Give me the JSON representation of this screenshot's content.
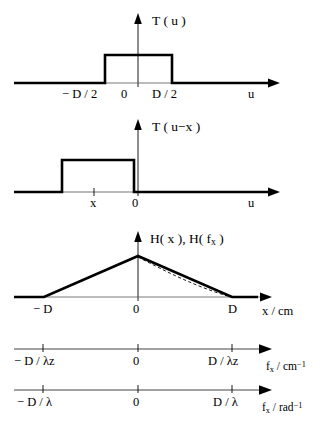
{
  "figure": {
    "panels": [
      {
        "id": "panel-tu",
        "type": "rect-function",
        "function_label": "T ( u )",
        "axis_label": "u",
        "ticks": [
          {
            "label": "− D / 2"
          },
          {
            "label": "0"
          },
          {
            "label": "D / 2"
          }
        ]
      },
      {
        "id": "panel-tux",
        "type": "rect-function-shifted",
        "function_label": "T ( u−x )",
        "axis_label": "u",
        "ticks": [
          {
            "label": "x"
          },
          {
            "label": "0"
          }
        ]
      },
      {
        "id": "panel-hx",
        "type": "triangle-function",
        "function_label_parts": {
          "lead": "H( x ), H( f",
          "subscript": "x",
          "trail": " )"
        },
        "function_label": "H( x ), H( f x )",
        "axis_label": "x / cm",
        "ticks": [
          {
            "label": "− D"
          },
          {
            "label": "0"
          },
          {
            "label": "D"
          }
        ],
        "has_dashed_overlay": true
      },
      {
        "id": "panel-fx-cm",
        "type": "numeric-axis",
        "axis_label_parts": {
          "lead": "f",
          "subscript": "x",
          "mid": " / cm",
          "superscript": "−1"
        },
        "axis_label": "f x / cm -1",
        "ticks": [
          {
            "label": "− D / λz"
          },
          {
            "label": "0"
          },
          {
            "label": "D / λz"
          }
        ]
      },
      {
        "id": "panel-fx-rad",
        "type": "numeric-axis",
        "axis_label_parts": {
          "lead": "f",
          "subscript": "x",
          "mid": " / rad",
          "superscript": "−1"
        },
        "axis_label": "f x / rad -1",
        "ticks": [
          {
            "label": "− D / λ"
          },
          {
            "label": "0"
          },
          {
            "label": "D / λ"
          }
        ]
      }
    ],
    "colors": {
      "ink": "#000000",
      "thin_rule": "#555555",
      "background": "#ffffff"
    }
  }
}
